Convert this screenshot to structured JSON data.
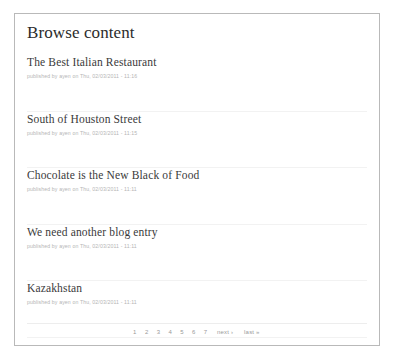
{
  "panel": {
    "title": "Browse content"
  },
  "nodes": [
    {
      "title": "The Best Italian Restaurant",
      "meta": "published by ayen on Thu, 02/03/2011 - 11:16"
    },
    {
      "title": "South of Houston Street",
      "meta": "published by ayen on Thu, 02/03/2011 - 11:15"
    },
    {
      "title": "Chocolate is the New Black of Food",
      "meta": "published by ayen on Thu, 02/03/2011 - 11:11"
    },
    {
      "title": "We need another blog entry",
      "meta": "published by ayen on Thu, 02/03/2011 - 11:11"
    },
    {
      "title": "Kazakhstan",
      "meta": "published by ayen on Thu, 02/03/2011 - 11:11"
    }
  ],
  "pager": {
    "items": [
      {
        "label": "1",
        "wide": false
      },
      {
        "label": "2",
        "wide": false
      },
      {
        "label": "3",
        "wide": false
      },
      {
        "label": "4",
        "wide": false
      },
      {
        "label": "5",
        "wide": false
      },
      {
        "label": "6",
        "wide": false
      },
      {
        "label": "7",
        "wide": false
      },
      {
        "label": "next ›",
        "wide": true
      },
      {
        "label": "last »",
        "wide": true
      }
    ]
  },
  "colors": {
    "panel_border": "#b9b9b9",
    "title_text": "#2b2b2b",
    "node_title_text": "#3a3a3a",
    "meta_text": "#b5b5b5",
    "separator": "#f2f2f2",
    "pager_text": "#9a9a9a",
    "background": "#ffffff"
  }
}
